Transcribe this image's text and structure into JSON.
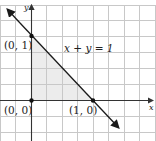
{
  "diagram": {
    "type": "coordinate-plane",
    "colors": {
      "background": "#ffffff",
      "grid": "#c8c8c8",
      "axis": "#333333",
      "line": "#1a1a1a",
      "shade": "#ececec",
      "point": "#111111"
    },
    "axes": {
      "x_label": "x",
      "y_label": "y"
    },
    "line": {
      "equation": "x + y = 1"
    },
    "points": [
      {
        "label": "(0, 1)",
        "x": 0,
        "y": 1
      },
      {
        "label": "(0, 0)",
        "x": 0,
        "y": 0
      },
      {
        "label": "(1, 0)",
        "x": 1,
        "y": 0
      }
    ],
    "shaded_region": "triangle (0,0)-(1,0)-(0,1)"
  }
}
